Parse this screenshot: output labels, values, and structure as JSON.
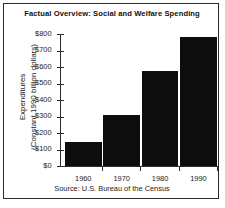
{
  "figure": {
    "title": "Factual Overview: Social and Welfare Spending",
    "source_note": "Source: U.S. Bureau of the Census",
    "ylabel_line1": "Expenditures",
    "ylabel_line2": "(Constant 1990 billion dollars)",
    "bar_color": "#0d0d0d",
    "axis_color": "#2b2b2b",
    "background_color": "#ffffff"
  },
  "chart_data": {
    "type": "bar",
    "title": "Factual Overview: Social and Welfare Spending",
    "xlabel": "",
    "ylabel": "Expenditures (Constant 1990 billion dollars)",
    "categories": [
      "1960",
      "1970",
      "1980",
      "1990"
    ],
    "values": [
      145,
      310,
      575,
      780
    ],
    "ylim": [
      0,
      800
    ],
    "ytick_values": [
      0,
      100,
      200,
      300,
      400,
      500,
      600,
      700,
      800
    ],
    "ytick_labels": [
      "$0",
      "$100",
      "$200",
      "$300",
      "$400",
      "$500",
      "$600",
      "$700",
      "$800"
    ],
    "grid": false,
    "legend": false,
    "annotations": [
      "Source: U.S. Bureau of the Census"
    ]
  }
}
